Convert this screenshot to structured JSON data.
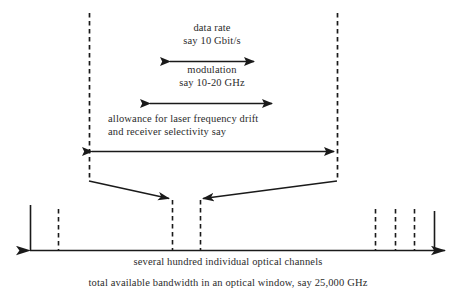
{
  "figure": {
    "background": "#ffffff",
    "ink": "#1a1a1a",
    "text_color": "#2b2b2b"
  },
  "labels": {
    "data_rate_line1": "data rate",
    "data_rate_line2": "say 10 Gbit/s",
    "modulation_line1": "modulation",
    "modulation_line2": "say 10-20 GHz",
    "allowance_line1": "allowance for laser frequency drift",
    "allowance_line2": "and receiver selectivity say"
  },
  "captions": {
    "channels": "several hundred individual optical channels",
    "bandwidth": "total available bandwidth in an optical window, say 25,000 GHz"
  },
  "arrows": [
    {
      "name": "data-rate-arrow",
      "x1": 170,
      "x2": 254,
      "y": 61
    },
    {
      "name": "modulation-arrow",
      "x1": 150,
      "x2": 272,
      "y": 103
    },
    {
      "name": "allowance-arrow",
      "x1": 92,
      "x2": 334,
      "y": 151
    }
  ],
  "guides": [
    {
      "name": "left-guide",
      "x": 89,
      "y1": 13,
      "y2": 181
    },
    {
      "name": "right-guide",
      "x": 337,
      "y1": 13,
      "y2": 181
    }
  ],
  "converging_arrows": [
    {
      "name": "left-converging-arrow",
      "x1": 89,
      "y1": 181,
      "x2": 172,
      "y2": 199
    },
    {
      "name": "right-converging-arrow",
      "x1": 337,
      "y1": 181,
      "x2": 200,
      "y2": 199
    }
  ],
  "axis": {
    "name": "bandwidth-axis",
    "y": 250,
    "x_left": 28,
    "x_right": 447
  },
  "channel_lines": [
    {
      "name": "channel-line-solid-left",
      "x": 30,
      "y_top": 205,
      "style": "solid"
    },
    {
      "name": "channel-line-dashed-1",
      "x": 58,
      "y_top": 209,
      "style": "dashed"
    },
    {
      "name": "channel-line-dashed-2",
      "x": 172,
      "y_top": 200,
      "style": "dashed"
    },
    {
      "name": "channel-line-dashed-3",
      "x": 200,
      "y_top": 200,
      "style": "dashed"
    },
    {
      "name": "channel-line-dashed-4",
      "x": 375,
      "y_top": 209,
      "style": "dashed"
    },
    {
      "name": "channel-line-dashed-5",
      "x": 395,
      "y_top": 209,
      "style": "dashed"
    },
    {
      "name": "channel-line-dashed-6",
      "x": 414,
      "y_top": 209,
      "style": "dashed"
    },
    {
      "name": "channel-line-solid-right",
      "x": 434,
      "y_top": 211,
      "style": "solid"
    }
  ]
}
